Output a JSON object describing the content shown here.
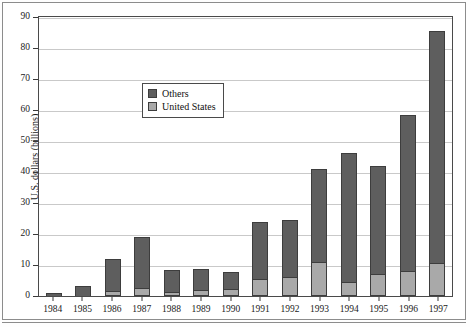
{
  "chart_data": {
    "type": "bar",
    "subtype": "stacked-vertical",
    "title": "",
    "xlabel": "",
    "ylabel": "U.S. dollars (billions)",
    "ylim": [
      0,
      90
    ],
    "ytick_step": 10,
    "yticks": [
      0,
      10,
      20,
      30,
      40,
      50,
      60,
      70,
      80,
      90
    ],
    "categories": [
      "1984",
      "1985",
      "1986",
      "1987",
      "1988",
      "1989",
      "1990",
      "1991",
      "1992",
      "1993",
      "1994",
      "1995",
      "1996",
      "1997"
    ],
    "grid": true,
    "grid_axis": "y",
    "legend_position": "inside-upper-left",
    "series": [
      {
        "name": "Others",
        "color": "#5e5e5e",
        "values": [
          0.9,
          3.3,
          10.3,
          16.3,
          7.2,
          7.0,
          5.4,
          18.5,
          18.5,
          30.0,
          41.5,
          35.0,
          50.5,
          75.0
        ]
      },
      {
        "name": "United States",
        "color": "#a9a9a9",
        "values": [
          0.0,
          0.0,
          1.5,
          2.7,
          1.3,
          1.8,
          2.3,
          5.5,
          6.0,
          11.0,
          4.5,
          7.0,
          8.0,
          10.5
        ]
      }
    ],
    "totals": [
      0.9,
      3.3,
      11.8,
      19.0,
      8.5,
      8.8,
      7.7,
      24.0,
      24.5,
      41.0,
      46.0,
      42.0,
      58.5,
      85.5
    ]
  },
  "legend": {
    "items": [
      {
        "label": "Others",
        "color": "#5e5e5e"
      },
      {
        "label": "United States",
        "color": "#a9a9a9"
      }
    ]
  },
  "axes": {
    "y_label": "U.S. dollars (billions)"
  }
}
